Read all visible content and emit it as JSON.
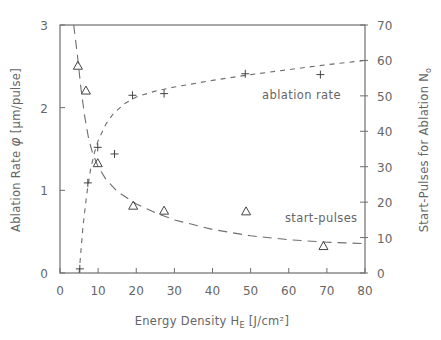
{
  "chart_data": {
    "type": "scatter",
    "title": "",
    "xlabel": "Energy Density H_E [J/cm²]",
    "xlabel_parts": {
      "main": "Energy Density H",
      "sub": "E",
      "unit": " [J/cm²]"
    },
    "ylabel_left": "Ablation Rate φ [μm/pulse]",
    "ylabel_left_parts": {
      "main": "Ablation Rate ",
      "sym": "φ",
      "unit": " [μm/pulse]"
    },
    "ylabel_right": "Start-Pulses for Ablation N₀",
    "ylabel_right_parts": {
      "main": "Start-Pulses for Ablation N",
      "sub": "o"
    },
    "xlim": [
      0,
      80
    ],
    "ylim_left": [
      0,
      3
    ],
    "ylim_right": [
      0,
      70
    ],
    "x_ticks": [
      0,
      10,
      20,
      30,
      40,
      50,
      60,
      70,
      80
    ],
    "y_ticks_left": [
      0,
      1,
      2,
      3
    ],
    "y_ticks_right": [
      0,
      10,
      20,
      30,
      40,
      50,
      60,
      70
    ],
    "grid": false,
    "legend": "inline annotations",
    "series": [
      {
        "name": "ablation rate",
        "axis": "left",
        "marker": "+",
        "line_style": "short-dash",
        "points": [
          [
            5.2,
            0.05
          ],
          [
            7.3,
            1.09
          ],
          [
            9.9,
            1.52
          ],
          [
            14.3,
            1.44
          ],
          [
            19.0,
            2.15
          ],
          [
            27.3,
            2.17
          ],
          [
            48.6,
            2.41
          ],
          [
            68.3,
            2.4
          ]
        ],
        "fit_curve": [
          [
            5.0,
            0.0
          ],
          [
            6.0,
            0.55
          ],
          [
            7.0,
            0.95
          ],
          [
            8.0,
            1.25
          ],
          [
            9.0,
            1.45
          ],
          [
            10.0,
            1.6
          ],
          [
            12.0,
            1.8
          ],
          [
            14.0,
            1.93
          ],
          [
            17.0,
            2.05
          ],
          [
            20.0,
            2.13
          ],
          [
            25.0,
            2.2
          ],
          [
            30.0,
            2.25
          ],
          [
            40.0,
            2.33
          ],
          [
            50.0,
            2.4
          ],
          [
            60.0,
            2.46
          ],
          [
            70.0,
            2.52
          ],
          [
            80.0,
            2.57
          ]
        ],
        "label": "ablation rate",
        "label_pos": [
          53,
          2.1
        ]
      },
      {
        "name": "start-pulses",
        "axis": "right",
        "marker": "triangle",
        "line_style": "long-dash",
        "points": [
          [
            4.7,
            58.5
          ],
          [
            6.8,
            51.5
          ],
          [
            9.9,
            31.0
          ],
          [
            19.2,
            19.0
          ],
          [
            27.3,
            17.6
          ],
          [
            48.8,
            17.4
          ],
          [
            69.1,
            7.6
          ]
        ],
        "fit_curve": [
          [
            3.6,
            70.0
          ],
          [
            4.5,
            62.0
          ],
          [
            5.5,
            52.0
          ],
          [
            6.5,
            44.0
          ],
          [
            7.5,
            38.0
          ],
          [
            8.5,
            34.0
          ],
          [
            10.0,
            30.0
          ],
          [
            12.0,
            26.5
          ],
          [
            15.0,
            23.0
          ],
          [
            20.0,
            19.5
          ],
          [
            25.0,
            17.0
          ],
          [
            30.0,
            15.0
          ],
          [
            40.0,
            12.3
          ],
          [
            50.0,
            10.5
          ],
          [
            60.0,
            9.4
          ],
          [
            70.0,
            8.7
          ],
          [
            80.0,
            8.3
          ]
        ],
        "label": "start-pulses",
        "label_pos": [
          59,
          14.5
        ]
      }
    ]
  }
}
